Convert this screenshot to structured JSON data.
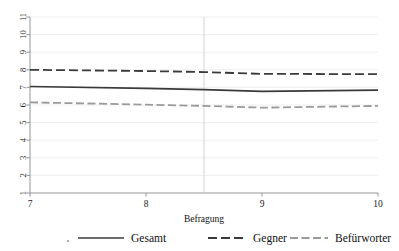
{
  "chart_data": {
    "type": "line",
    "title": "",
    "xlabel": "Befragung",
    "ylabel": "",
    "xlim": [
      7,
      10
    ],
    "ylim": [
      1,
      11
    ],
    "grid": true,
    "legend_position": "bottom",
    "x_ticks": [
      "7",
      "8",
      "9",
      "10"
    ],
    "x_tick_values": [
      7,
      8,
      9,
      10
    ],
    "y_ticks": [
      "1",
      "2",
      "3",
      "4",
      "5",
      "6",
      "7",
      "8",
      "9",
      "10",
      "11"
    ],
    "y_tick_values": [
      1,
      2,
      3,
      4,
      5,
      6,
      7,
      8,
      9,
      10,
      11
    ],
    "reference_line_x": 8.5,
    "x": [
      7,
      8,
      8.5,
      9,
      10
    ],
    "series": [
      {
        "name": "Gesamt",
        "style": "solid",
        "color": "#3a3a3a",
        "values": [
          7.05,
          6.95,
          6.87,
          6.77,
          6.85
        ]
      },
      {
        "name": "Gegner",
        "style": "dashed",
        "color": "#3a3a3a",
        "values": [
          8.0,
          7.93,
          7.87,
          7.77,
          7.75
        ]
      },
      {
        "name": "Befürworter",
        "style": "dash-dot",
        "color": "#9a9a9a",
        "values": [
          6.15,
          6.02,
          5.95,
          5.85,
          5.95
        ]
      }
    ]
  },
  "legend": {
    "items": [
      {
        "label": "Gesamt",
        "style": "solid",
        "color": "#3a3a3a"
      },
      {
        "label": "Gegner",
        "style": "dashed",
        "color": "#3a3a3a"
      },
      {
        "label": "Befürworter",
        "style": "dash-dot",
        "color": "#9a9a9a"
      }
    ]
  },
  "colors": {
    "grid": "#e6e6e6",
    "axis": "#8a8a8a",
    "reference_line": "#cfcfcf",
    "dark_series": "#3a3a3a",
    "light_series": "#9a9a9a",
    "background": "#ffffff"
  }
}
